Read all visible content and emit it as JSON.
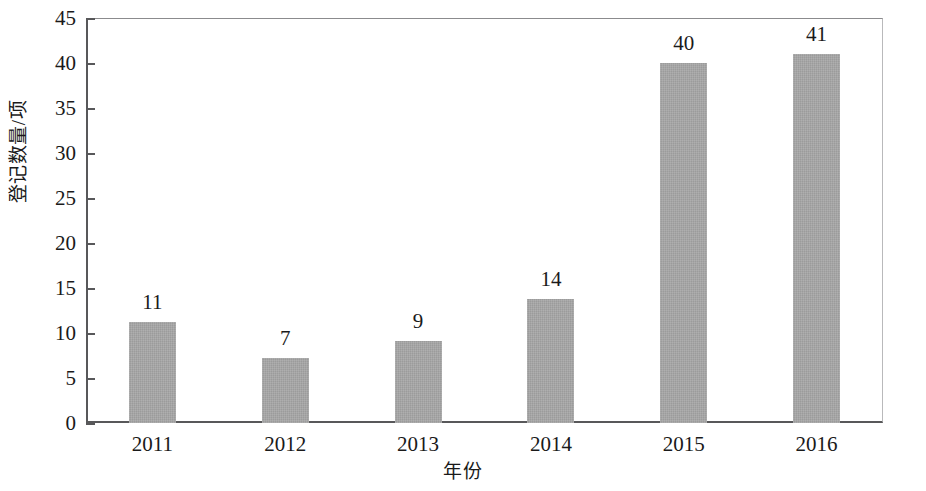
{
  "chart_data": {
    "type": "bar",
    "title": "",
    "subtitle": "",
    "xlabel": "年份",
    "ylabel": "登记数量/项",
    "categories": [
      "2011",
      "2012",
      "2013",
      "2014",
      "2015",
      "2016"
    ],
    "values": [
      11,
      7,
      9,
      14,
      40,
      41
    ],
    "data_labels": [
      "11",
      "7",
      "9",
      "14",
      "40",
      "41"
    ],
    "bar_plot_values": [
      11.2,
      7.2,
      9.1,
      13.8,
      40.0,
      41.0
    ],
    "ylim": [
      0,
      45
    ],
    "yticks": [
      0,
      5,
      10,
      15,
      20,
      25,
      30,
      35,
      40,
      45
    ],
    "ytick_labels": [
      "0",
      "5",
      "10",
      "15",
      "20",
      "25",
      "30",
      "35",
      "40",
      "45"
    ],
    "grid": false,
    "legend": null,
    "legend_position": "none",
    "bar_color": "#a6a6a6",
    "axis_color": "#58585a",
    "text_color": "#1a1a1a",
    "background_color": "#ffffff",
    "annotations": []
  }
}
